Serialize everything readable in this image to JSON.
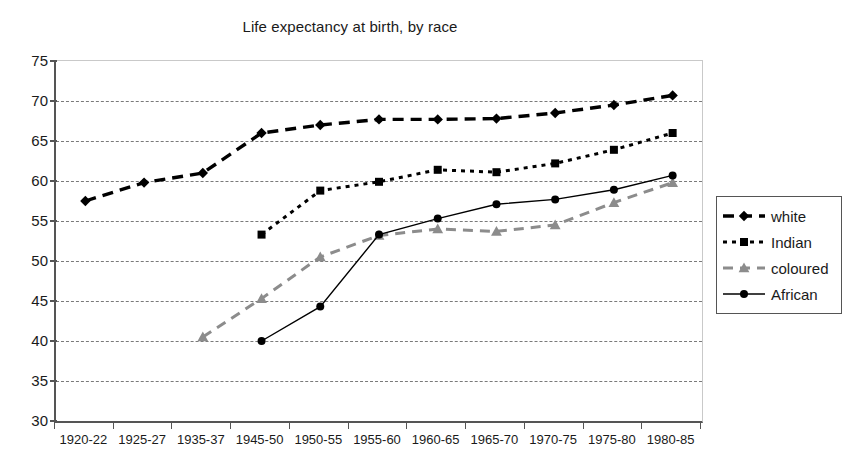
{
  "chart_data": {
    "type": "line",
    "title": "Life expectancy at birth, by race",
    "xlabel": "",
    "ylabel": "",
    "ylim": [
      30,
      75
    ],
    "ytick_step": 5,
    "yticks": [
      75,
      70,
      65,
      60,
      55,
      50,
      45,
      40,
      35,
      30
    ],
    "grid": true,
    "legend_position": "right",
    "categories": [
      "1920-22",
      "1925-27",
      "1935-37",
      "1945-50",
      "1950-55",
      "1955-60",
      "1960-65",
      "1965-70",
      "1970-75",
      "1975-80",
      "1980-85"
    ],
    "series": [
      {
        "name": "white",
        "color": "#000000",
        "marker": "diamond",
        "line_style": "dashed-thick",
        "values": [
          57.5,
          59.8,
          61.0,
          66.0,
          67.0,
          67.7,
          67.7,
          67.8,
          68.5,
          69.5,
          70.7
        ]
      },
      {
        "name": "Indian",
        "color": "#000000",
        "marker": "square",
        "line_style": "dotted",
        "values": [
          null,
          null,
          null,
          53.3,
          58.8,
          59.9,
          61.4,
          61.1,
          62.2,
          63.9,
          66.0
        ]
      },
      {
        "name": "coloured",
        "color": "#8c8c8c",
        "marker": "triangle",
        "line_style": "dashed",
        "values": [
          null,
          null,
          40.5,
          45.3,
          50.5,
          53.2,
          54.0,
          53.7,
          54.5,
          57.3,
          59.8
        ]
      },
      {
        "name": "African",
        "color": "#000000",
        "marker": "circle",
        "line_style": "solid-thin",
        "values": [
          null,
          null,
          null,
          40.0,
          44.3,
          53.3,
          55.3,
          57.1,
          57.7,
          58.9,
          60.7
        ]
      }
    ]
  },
  "legend": {
    "items": [
      {
        "label": "white"
      },
      {
        "label": "Indian"
      },
      {
        "label": "coloured"
      },
      {
        "label": "African"
      }
    ]
  }
}
